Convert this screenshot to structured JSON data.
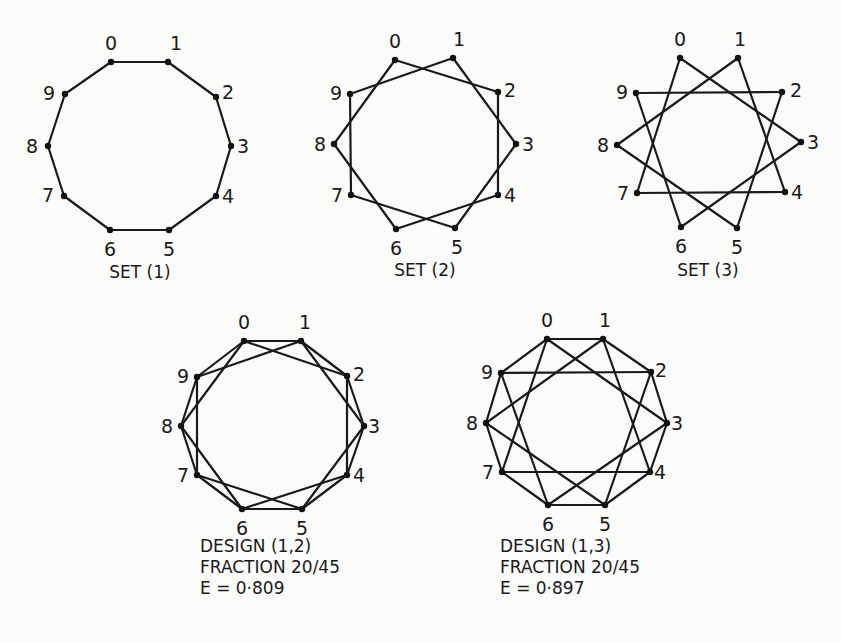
{
  "figures": [
    {
      "id": "set1",
      "caption_lines": [
        "SET (1)"
      ],
      "step": 1,
      "vertices": [
        [
          111,
          62
        ],
        [
          168,
          62
        ],
        [
          216,
          97
        ],
        [
          231,
          146
        ],
        [
          216,
          196
        ],
        [
          169,
          230
        ],
        [
          110,
          230
        ],
        [
          64,
          196
        ],
        [
          48,
          146
        ],
        [
          65,
          94
        ]
      ],
      "label_offsets": [
        [
          -6,
          -12
        ],
        [
          2,
          -12
        ],
        [
          6,
          2
        ],
        [
          6,
          7
        ],
        [
          6,
          7
        ],
        [
          -6,
          26
        ],
        [
          -6,
          26
        ],
        [
          -22,
          6
        ],
        [
          -22,
          7
        ],
        [
          -22,
          6
        ]
      ],
      "caption_pos": [
        140,
        278
      ]
    },
    {
      "id": "set2",
      "caption_lines": [
        "SET (2)"
      ],
      "step": 2,
      "vertices": [
        [
          395,
          60
        ],
        [
          453,
          58
        ],
        [
          498,
          92
        ],
        [
          516,
          144
        ],
        [
          498,
          195
        ],
        [
          455,
          228
        ],
        [
          396,
          229
        ],
        [
          351,
          195
        ],
        [
          334,
          144
        ],
        [
          350,
          94
        ]
      ],
      "label_offsets": [
        [
          -6,
          -12
        ],
        [
          0,
          -12
        ],
        [
          6,
          5
        ],
        [
          6,
          7
        ],
        [
          6,
          7
        ],
        [
          -4,
          26
        ],
        [
          -6,
          26
        ],
        [
          -20,
          7
        ],
        [
          -20,
          7
        ],
        [
          -20,
          6
        ]
      ],
      "caption_pos": [
        425,
        276
      ]
    },
    {
      "id": "set3",
      "caption_lines": [
        "SET (3)"
      ],
      "step": 3,
      "vertices": [
        [
          680,
          58
        ],
        [
          738,
          58
        ],
        [
          782,
          92
        ],
        [
          801,
          142
        ],
        [
          785,
          192
        ],
        [
          737,
          228
        ],
        [
          681,
          227
        ],
        [
          637,
          193
        ],
        [
          617,
          145
        ],
        [
          636,
          93
        ]
      ],
      "label_offsets": [
        [
          -6,
          -12
        ],
        [
          -4,
          -12
        ],
        [
          8,
          5
        ],
        [
          6,
          7
        ],
        [
          6,
          7
        ],
        [
          -6,
          26
        ],
        [
          -6,
          26
        ],
        [
          -20,
          7
        ],
        [
          -20,
          7
        ],
        [
          -20,
          6
        ]
      ],
      "caption_pos": [
        708,
        276
      ]
    },
    {
      "id": "design12",
      "caption_lines": [
        "DESIGN (1,2)",
        "FRACTION 20/45",
        "E = 0·809"
      ],
      "steps": [
        1,
        2
      ],
      "vertices": [
        [
          244,
          341
        ],
        [
          301,
          341
        ],
        [
          347,
          376
        ],
        [
          364,
          426
        ],
        [
          347,
          475
        ],
        [
          302,
          509
        ],
        [
          242,
          509
        ],
        [
          197,
          475
        ],
        [
          181,
          426
        ],
        [
          197,
          377
        ]
      ],
      "label_offsets": [
        [
          -6,
          -12
        ],
        [
          -2,
          -12
        ],
        [
          6,
          5
        ],
        [
          4,
          7
        ],
        [
          6,
          7
        ],
        [
          -6,
          26
        ],
        [
          -6,
          26
        ],
        [
          -20,
          7
        ],
        [
          -20,
          7
        ],
        [
          -20,
          6
        ]
      ],
      "caption_pos": [
        200,
        552
      ]
    },
    {
      "id": "design13",
      "caption_lines": [
        "DESIGN (1,3)",
        "FRACTION 20/45",
        "E = 0·897"
      ],
      "steps": [
        1,
        3
      ],
      "vertices": [
        [
          547,
          339
        ],
        [
          603,
          339
        ],
        [
          651,
          372
        ],
        [
          667,
          423
        ],
        [
          650,
          472
        ],
        [
          605,
          505
        ],
        [
          548,
          505
        ],
        [
          502,
          472
        ],
        [
          486,
          423
        ],
        [
          501,
          373
        ]
      ],
      "label_offsets": [
        [
          -6,
          -12
        ],
        [
          -4,
          -12
        ],
        [
          4,
          5
        ],
        [
          4,
          7
        ],
        [
          4,
          7
        ],
        [
          -6,
          26
        ],
        [
          -6,
          26
        ],
        [
          -20,
          7
        ],
        [
          -20,
          7
        ],
        [
          -20,
          6
        ]
      ],
      "caption_pos": [
        500,
        552
      ]
    }
  ],
  "vertex_labels": [
    "0",
    "1",
    "2",
    "3",
    "4",
    "5",
    "6",
    "7",
    "8",
    "9"
  ]
}
